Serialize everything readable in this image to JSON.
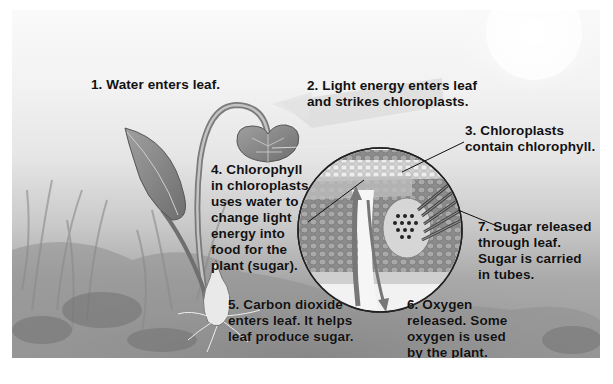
{
  "diagram": {
    "colors": {
      "background_light": "#f5f5f5",
      "ground_dark": "#9a9a9a",
      "text": "#111111",
      "leaf": "#8a8a8a"
    },
    "labels": [
      {
        "id": "step-1",
        "lines": [
          "1. Water enters leaf."
        ]
      },
      {
        "id": "step-2",
        "lines": [
          "2. Light energy enters leaf",
          "and strikes chloroplasts."
        ]
      },
      {
        "id": "step-3",
        "lines": [
          "3. Chloroplasts",
          "contain chlorophyll."
        ]
      },
      {
        "id": "step-4",
        "lines": [
          "4. Chlorophyll",
          "in chloroplasts",
          "uses water to",
          "change light",
          "energy into",
          "food for the",
          "plant (sugar)."
        ]
      },
      {
        "id": "step-5",
        "lines": [
          "5. Carbon dioxide",
          "enters leaf. It helps",
          "leaf produce sugar."
        ]
      },
      {
        "id": "step-6",
        "lines": [
          "6. Oxygen",
          "released. Some",
          "oxygen is used",
          "by the plant."
        ]
      },
      {
        "id": "step-7",
        "lines": [
          "7. Sugar released",
          "through leaf.",
          "Sugar is carried",
          "in tubes."
        ]
      }
    ],
    "illustrations": [
      "plant-with-leaves",
      "sun-glow",
      "leaf-cross-section-magnifier",
      "light-arrow",
      "carbon-dioxide-arrow",
      "oxygen-arrow",
      "bulb-roots",
      "grass-background"
    ]
  }
}
